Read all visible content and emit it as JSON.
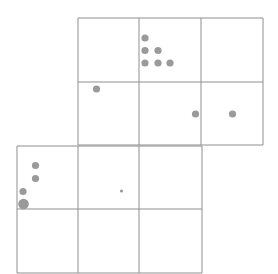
{
  "diagram": {
    "colors": {
      "background": "#ffffff",
      "grid_line": "#8f8f8f",
      "dot": "#9a9a9a"
    },
    "grids": [
      {
        "name": "upper-block",
        "x_lines": [
          78,
          139,
          201,
          263
        ],
        "y_lines": [
          18,
          82,
          145
        ]
      },
      {
        "name": "lower-block",
        "x_lines": [
          17,
          78,
          139,
          202
        ],
        "y_lines": [
          146,
          209,
          273
        ]
      }
    ],
    "dots": [
      {
        "cx": 145,
        "cy": 38,
        "r": 3.6
      },
      {
        "cx": 145,
        "cy": 50.5,
        "r": 3.6
      },
      {
        "cx": 158,
        "cy": 50.5,
        "r": 3.6
      },
      {
        "cx": 145,
        "cy": 63,
        "r": 3.6
      },
      {
        "cx": 158,
        "cy": 63,
        "r": 3.6
      },
      {
        "cx": 170,
        "cy": 63,
        "r": 3.6
      },
      {
        "cx": 96.5,
        "cy": 89,
        "r": 3.6
      },
      {
        "cx": 195.5,
        "cy": 114,
        "r": 3.6
      },
      {
        "cx": 232.5,
        "cy": 114,
        "r": 3.6
      },
      {
        "cx": 35.5,
        "cy": 165.5,
        "r": 3.6
      },
      {
        "cx": 35.5,
        "cy": 178.5,
        "r": 3.6
      },
      {
        "cx": 23,
        "cy": 191.5,
        "r": 3.6
      },
      {
        "cx": 23.5,
        "cy": 204,
        "r": 5.3
      },
      {
        "cx": 121.5,
        "cy": 191,
        "r": 1.6
      }
    ]
  }
}
